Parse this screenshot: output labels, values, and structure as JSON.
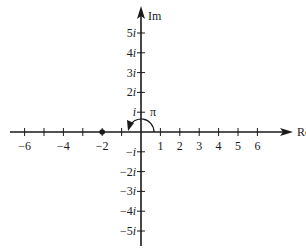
{
  "diagram": {
    "axes": {
      "x_label": "Re",
      "y_label": "Im",
      "x_range": [
        -6,
        6
      ],
      "y_range": [
        -5,
        5
      ]
    },
    "x_ticks": [
      {
        "value": -6,
        "label": "−6"
      },
      {
        "value": -5,
        "label": ""
      },
      {
        "value": -4,
        "label": "−4"
      },
      {
        "value": -3,
        "label": ""
      },
      {
        "value": -2,
        "label": "−2"
      },
      {
        "value": -1,
        "label": ""
      },
      {
        "value": 1,
        "label": "1"
      },
      {
        "value": 2,
        "label": "2"
      },
      {
        "value": 3,
        "label": "3"
      },
      {
        "value": 4,
        "label": "4"
      },
      {
        "value": 5,
        "label": "5"
      },
      {
        "value": 6,
        "label": "6"
      }
    ],
    "y_ticks": [
      {
        "value": 5,
        "coef": "5",
        "unit": "i"
      },
      {
        "value": 4,
        "coef": "4",
        "unit": "i"
      },
      {
        "value": 3,
        "coef": "3",
        "unit": "i"
      },
      {
        "value": 2,
        "coef": "2",
        "unit": "i"
      },
      {
        "value": 1,
        "coef": "",
        "unit": "i"
      },
      {
        "value": -1,
        "coef": "−",
        "unit": "i"
      },
      {
        "value": -2,
        "coef": "−2",
        "unit": "i"
      },
      {
        "value": -3,
        "coef": "−3",
        "unit": "i"
      },
      {
        "value": -4,
        "coef": "−4",
        "unit": "i"
      },
      {
        "value": -5,
        "coef": "−5",
        "unit": "i"
      }
    ],
    "point": {
      "re": -2,
      "im": 0
    },
    "angle": {
      "label": "π",
      "from_deg": 0,
      "to_deg": 180
    }
  }
}
